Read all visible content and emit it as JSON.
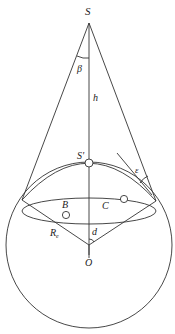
{
  "diagram": {
    "type": "geometry-figure",
    "colors": {
      "stroke": "#333333",
      "background": "#ffffff"
    },
    "labels": {
      "apex": "S",
      "angle_beta": "β",
      "height": "h",
      "subpoint": "S'",
      "angle_epsilon": "ε",
      "point_b": "B",
      "point_c": "C",
      "radius": "R",
      "radius_subscript": "e",
      "angle_d": "d",
      "center": "O"
    }
  }
}
